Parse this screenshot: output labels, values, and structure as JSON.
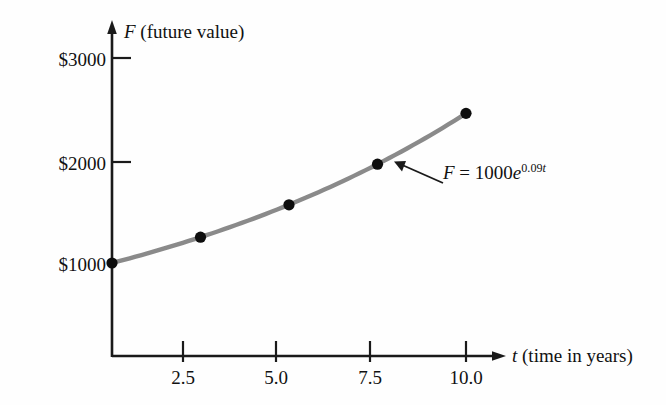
{
  "chart_data": {
    "type": "line",
    "title": "",
    "xlabel": "t (time in years)",
    "ylabel": "F (future value)",
    "xlim": [
      0,
      11.0
    ],
    "ylim": [
      0,
      3400
    ],
    "grid": false,
    "legend_position": "none",
    "x": [
      0,
      2.5,
      5.0,
      7.5,
      10.0
    ],
    "series": [
      {
        "name": "F = 1000e^(0.09t)",
        "values": [
          1000,
          1252,
          1568,
          1964,
          2460
        ]
      }
    ],
    "xticks": [
      "2.5",
      "5.0",
      "7.5",
      "10.0"
    ],
    "xtick_values": [
      2.5,
      5.0,
      7.5,
      10.0
    ],
    "yticks": [
      "$1000",
      "$2000",
      "$3000"
    ],
    "ytick_values": [
      1000,
      2000,
      3000
    ],
    "annotations": [
      {
        "text": "F = 1000e^0.09t",
        "points_to_curve": true
      }
    ],
    "curve_color": "#8a8a8a",
    "marker_color": "#0d0d0d",
    "axis_color": "#1a1a1a"
  },
  "axes": {
    "y_title_symbol": "F",
    "y_title_rest": " (future value)",
    "x_title_symbol": "t",
    "x_title_rest": " (time in years)"
  },
  "ytick_labels": {
    "t3000": "$3000",
    "t2000": "$2000",
    "t1000": "$1000"
  },
  "xtick_labels": {
    "t25": "2.5",
    "t50": "5.0",
    "t75": "7.5",
    "t100": "10.0"
  },
  "equation": {
    "lhs_symbol": "F",
    "equals": " =  1000",
    "base_symbol": "e",
    "exponent_number": "0.09",
    "exponent_symbol": "t"
  }
}
